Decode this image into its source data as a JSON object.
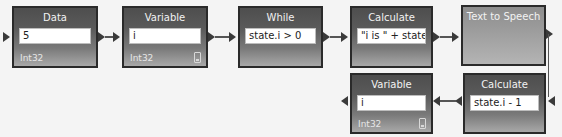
{
  "diagram": {
    "nodes": [
      {
        "id": "data",
        "title": "Data",
        "value": "5",
        "type": "Int32"
      },
      {
        "id": "variable-top",
        "title": "Variable",
        "value": "i",
        "type": "Int32"
      },
      {
        "id": "while",
        "title": "While",
        "value": "state.i > 0"
      },
      {
        "id": "calculate-top",
        "title": "Calculate",
        "value": "\"i is \" + state.i"
      },
      {
        "id": "text-to-speech",
        "title": "Text to Speech"
      },
      {
        "id": "calculate-bottom",
        "title": "Calculate",
        "value": "state.i - 1"
      },
      {
        "id": "variable-bottom",
        "title": "Variable",
        "value": "i",
        "type": "Int32"
      }
    ],
    "edges": [
      {
        "from": "data",
        "to": "variable-top"
      },
      {
        "from": "variable-top",
        "to": "while"
      },
      {
        "from": "while",
        "to": "calculate-top"
      },
      {
        "from": "calculate-top",
        "to": "text-to-speech"
      },
      {
        "from": "text-to-speech",
        "to": "calculate-bottom"
      },
      {
        "from": "calculate-bottom",
        "to": "variable-bottom"
      }
    ]
  }
}
